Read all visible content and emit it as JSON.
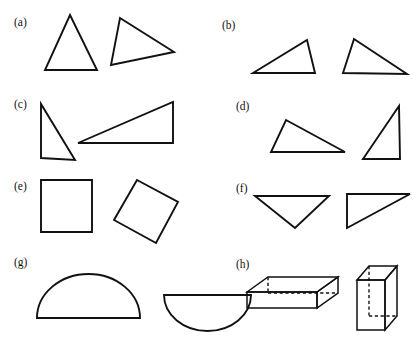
{
  "figure": {
    "background_color": "#ffffff",
    "stroke_color": "#111111",
    "width": 413,
    "height": 342,
    "panels": [
      {
        "key": "a",
        "label": "(a)",
        "label_x": 14,
        "label_y": 26,
        "description": "Two congruent triangles, second rotated",
        "shapes": [
          {
            "name": "triangle-a-left",
            "type": "polygon",
            "points": "70,15 97,70 45,70"
          },
          {
            "name": "triangle-a-right",
            "type": "polygon",
            "points": "120,18 174,52 111,65"
          }
        ]
      },
      {
        "key": "b",
        "label": "(b)",
        "label_x": 222,
        "label_y": 29,
        "description": "Two congruent scalene triangles, one mirrored",
        "shapes": [
          {
            "name": "triangle-b-left",
            "type": "polygon",
            "points": "253,73 307,40 315,73"
          },
          {
            "name": "triangle-b-right",
            "type": "polygon",
            "points": "354,39 407,74 343,73"
          }
        ]
      },
      {
        "key": "c",
        "label": "(c)",
        "label_x": 14,
        "label_y": 108,
        "description": "Two congruent right triangles in different orientations",
        "shapes": [
          {
            "name": "triangle-c-left",
            "type": "polygon",
            "points": "41,104 41,158 75,160"
          },
          {
            "name": "triangle-c-right",
            "type": "polygon",
            "points": "78,143 173,102 173,143"
          }
        ]
      },
      {
        "key": "d",
        "label": "(d)",
        "label_x": 236,
        "label_y": 110,
        "description": "Two congruent triangles, one rotated upright",
        "shapes": [
          {
            "name": "triangle-d-left",
            "type": "polygon",
            "points": "286,120 345,152 271,152"
          },
          {
            "name": "triangle-d-right",
            "type": "polygon",
            "points": "399,106 400,159 363,159"
          }
        ]
      },
      {
        "key": "e",
        "label": "(e)",
        "label_x": 14,
        "label_y": 190,
        "description": "A square and the same square rotated about 28 degrees",
        "shapes": [
          {
            "name": "square-e-left",
            "type": "polygon",
            "points": "41,180 92,180 92,232 41,232"
          },
          {
            "name": "square-e-right",
            "type": "polygon",
            "points": "137,180 178,202 156,243 114,220"
          }
        ]
      },
      {
        "key": "f",
        "label": "(f)",
        "label_x": 236,
        "label_y": 192,
        "description": "Two congruent triangles, one pointing down, one right triangle",
        "shapes": [
          {
            "name": "triangle-f-left",
            "type": "polygon",
            "points": "255,196 329,196 295,228"
          },
          {
            "name": "triangle-f-right",
            "type": "polygon",
            "points": "347,194 410,194 347,228"
          }
        ]
      },
      {
        "key": "g",
        "label": "(g)",
        "label_x": 14,
        "label_y": 266,
        "description": "A semicircle with flat side down and the same semicircle flipped with flat side up",
        "shapes": [
          {
            "name": "semicircle-g-left",
            "type": "path",
            "d": "M 37,318 L 140,318 A 51.5 44 0 0 0 37,318 Z"
          },
          {
            "name": "semicircle-g-right",
            "type": "path",
            "d": "M 164,295 L 251,295 A 43.5 36 0 0 1 164,295 Z"
          }
        ]
      },
      {
        "key": "h",
        "label": "(h)",
        "label_x": 236,
        "label_y": 268,
        "description": "A rectangular prism lying flat and the same prism standing upright, hidden edges dashed",
        "shapes": [
          {
            "name": "prism-h-flat-front-face",
            "type": "polygon",
            "points": "247,292 317,292 317,308 247,308"
          },
          {
            "name": "prism-h-flat-top-face",
            "type": "polygon",
            "points": "247,292 268,277 338,277 317,292"
          },
          {
            "name": "prism-h-flat-right-face",
            "type": "polygon",
            "points": "317,292 338,277 338,293 317,308"
          },
          {
            "name": "prism-h-flat-hidden-vertical",
            "type": "path",
            "d": "M 268,277 L 268,293"
          },
          {
            "name": "prism-h-flat-hidden-horizontal",
            "type": "path",
            "d": "M 268,293 L 338,293"
          },
          {
            "name": "prism-h-upright-front-face",
            "type": "polygon",
            "points": "357,280 385,280 385,330 357,330"
          },
          {
            "name": "prism-h-upright-top-face",
            "type": "polygon",
            "points": "357,280 369,266 397,266 385,280"
          },
          {
            "name": "prism-h-upright-right-face",
            "type": "polygon",
            "points": "385,280 397,266 397,316 385,330"
          },
          {
            "name": "prism-h-upright-hidden-vertical",
            "type": "path",
            "d": "M 369,266 L 369,316"
          },
          {
            "name": "prism-h-upright-hidden-horizontal",
            "type": "path",
            "d": "M 369,316 L 397,316"
          }
        ]
      }
    ]
  }
}
